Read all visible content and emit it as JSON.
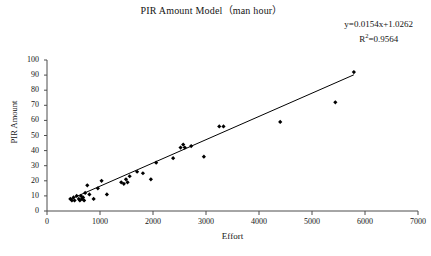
{
  "chart_data": {
    "type": "scatter",
    "title": "PIR Amount Model（man hour）",
    "xlabel": "Effort",
    "ylabel": "PIR Amount",
    "xlim": [
      0,
      7000
    ],
    "ylim": [
      0,
      100
    ],
    "xticks": [
      "0",
      "1000",
      "2000",
      "3000",
      "4000",
      "5000",
      "6000",
      "7000"
    ],
    "xtick_values": [
      0,
      1000,
      2000,
      3000,
      4000,
      5000,
      6000,
      7000
    ],
    "yticks": [
      "0",
      "10",
      "20",
      "30",
      "40",
      "50",
      "60",
      "70",
      "80",
      "90",
      "100"
    ],
    "ytick_values": [
      0,
      10,
      20,
      30,
      40,
      50,
      60,
      70,
      80,
      90,
      100
    ],
    "grid": false,
    "legend": false,
    "marker": "diamond",
    "marker_color": "#000000",
    "line_color": "#000000",
    "annotations": {
      "equation": "y=0.0154x+1.0262",
      "r_squared_prefix": "R",
      "r_squared_sup": "2",
      "r_squared_value": "=0.9564"
    },
    "trendline": {
      "slope": 0.0154,
      "intercept": 1.0262,
      "x_start": 430,
      "x_end": 5790
    },
    "points": [
      {
        "x": 440,
        "y": 8
      },
      {
        "x": 470,
        "y": 7
      },
      {
        "x": 500,
        "y": 9
      },
      {
        "x": 520,
        "y": 7
      },
      {
        "x": 560,
        "y": 10
      },
      {
        "x": 600,
        "y": 8
      },
      {
        "x": 620,
        "y": 7
      },
      {
        "x": 640,
        "y": 10
      },
      {
        "x": 660,
        "y": 8
      },
      {
        "x": 680,
        "y": 9
      },
      {
        "x": 700,
        "y": 7
      },
      {
        "x": 720,
        "y": 12
      },
      {
        "x": 760,
        "y": 17
      },
      {
        "x": 800,
        "y": 11
      },
      {
        "x": 880,
        "y": 8
      },
      {
        "x": 960,
        "y": 15
      },
      {
        "x": 1030,
        "y": 20
      },
      {
        "x": 1130,
        "y": 11
      },
      {
        "x": 1400,
        "y": 19
      },
      {
        "x": 1450,
        "y": 18
      },
      {
        "x": 1490,
        "y": 21
      },
      {
        "x": 1520,
        "y": 19
      },
      {
        "x": 1560,
        "y": 23
      },
      {
        "x": 1700,
        "y": 26
      },
      {
        "x": 1810,
        "y": 25
      },
      {
        "x": 1960,
        "y": 21
      },
      {
        "x": 2060,
        "y": 32
      },
      {
        "x": 2380,
        "y": 35
      },
      {
        "x": 2520,
        "y": 42
      },
      {
        "x": 2570,
        "y": 44
      },
      {
        "x": 2600,
        "y": 42
      },
      {
        "x": 2720,
        "y": 43
      },
      {
        "x": 2960,
        "y": 36
      },
      {
        "x": 3250,
        "y": 56
      },
      {
        "x": 3330,
        "y": 56
      },
      {
        "x": 4400,
        "y": 59
      },
      {
        "x": 5440,
        "y": 72
      },
      {
        "x": 5790,
        "y": 92
      }
    ]
  }
}
